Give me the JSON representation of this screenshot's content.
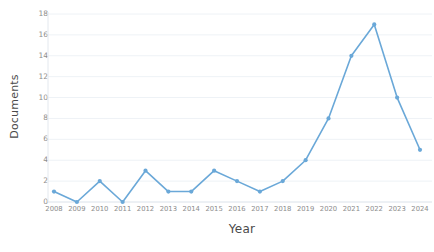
{
  "chart_data": {
    "type": "line",
    "title": "",
    "xlabel": "Year",
    "ylabel": "Documents",
    "categories": [
      "2008",
      "2009",
      "2010",
      "2011",
      "2012",
      "2013",
      "2014",
      "2015",
      "2016",
      "2017",
      "2018",
      "2019",
      "2020",
      "2021",
      "2022",
      "2023",
      "2024"
    ],
    "x": [
      2008,
      2009,
      2010,
      2011,
      2012,
      2013,
      2014,
      2015,
      2016,
      2017,
      2018,
      2019,
      2020,
      2021,
      2022,
      2023,
      2024
    ],
    "values": [
      1,
      0,
      2,
      0,
      3,
      1,
      1,
      3,
      2,
      1,
      2,
      4,
      8,
      14,
      17,
      10,
      5
    ],
    "series": [
      {
        "name": "Documents",
        "values": [
          1,
          0,
          2,
          0,
          3,
          1,
          1,
          3,
          2,
          1,
          2,
          4,
          8,
          14,
          17,
          10,
          5
        ]
      }
    ],
    "ylim": [
      0,
      18
    ],
    "yticks": [
      0,
      2,
      4,
      6,
      8,
      10,
      12,
      14,
      16,
      18
    ],
    "ytick_labels": [
      "0",
      "2",
      "4",
      "6",
      "8",
      "10",
      "12",
      "14",
      "16",
      "18"
    ],
    "xtick_labels": [
      "2008",
      "2009",
      "2010",
      "2011",
      "2012",
      "2013",
      "2014",
      "2015",
      "2016",
      "2017",
      "2018",
      "2019",
      "2020",
      "2021",
      "2022",
      "2023",
      "2024"
    ],
    "grid": "horizontal",
    "legend": "none",
    "line_color": "#6aa8d8",
    "marker_color": "#6aa8d8",
    "marker": "circle",
    "background": "#ffffff",
    "gridline_color": "#eef2f6",
    "tick_label_color": "#8d8d8d",
    "axis_title_color": "#4a4a4a"
  }
}
